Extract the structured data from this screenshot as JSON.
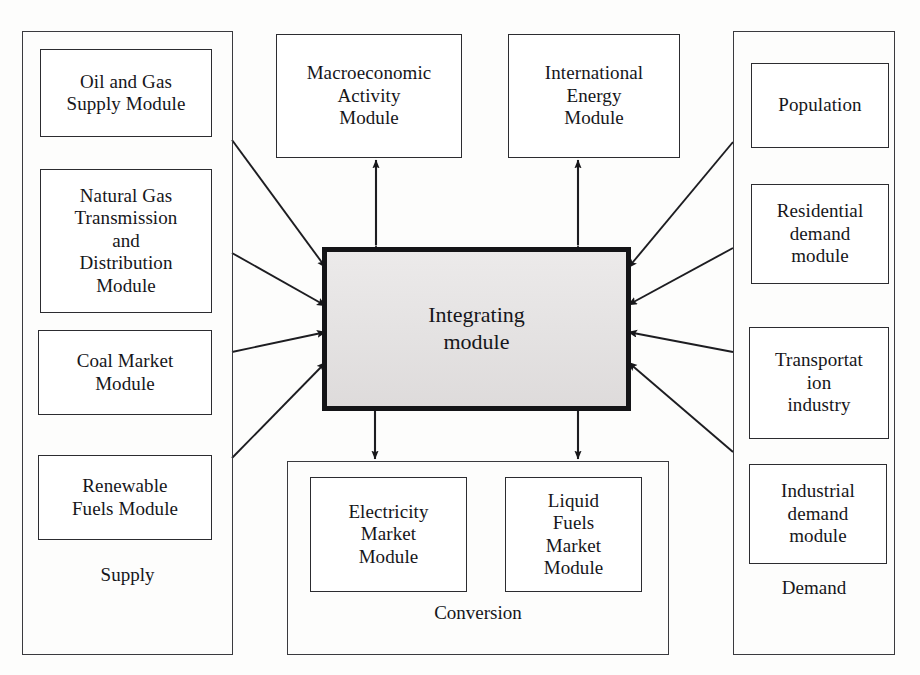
{
  "diagram": {
    "background_color": "#fdfdfc",
    "line_color": "#2c2c30",
    "center_fill_color": "#e8e6e6"
  },
  "center": {
    "label": "Integrating\nmodule"
  },
  "supply": {
    "caption": "Supply",
    "modules": [
      {
        "label": "Oil and Gas\nSupply Module"
      },
      {
        "label": "Natural Gas\nTransmission\nand\nDistribution\nModule"
      },
      {
        "label": "Coal Market\nModule"
      },
      {
        "label": "Renewable\nFuels Module"
      }
    ]
  },
  "demand": {
    "caption": "Demand",
    "modules": [
      {
        "label": "Population"
      },
      {
        "label": "Residential\ndemand\nmodule"
      },
      {
        "label": "Transportat\nion\nindustry"
      },
      {
        "label": "Industrial\ndemand\nmodule"
      }
    ]
  },
  "conversion": {
    "caption": "Conversion",
    "modules": [
      {
        "label": "Electricity\nMarket\nModule"
      },
      {
        "label": "Liquid\nFuels\nMarket\nModule"
      }
    ]
  },
  "top": {
    "modules": [
      {
        "label": "Macroeconomic\nActivity\nModule"
      },
      {
        "label": "International\nEnergy\nModule"
      }
    ]
  },
  "connections": [
    {
      "name": "supply-oil-gas-to-center",
      "direction": "one-way",
      "from": "supply",
      "to": "center"
    },
    {
      "name": "supply-natural-gas-to-center",
      "direction": "one-way",
      "from": "supply",
      "to": "center"
    },
    {
      "name": "supply-coal-to-center",
      "direction": "one-way",
      "from": "supply",
      "to": "center"
    },
    {
      "name": "supply-renewable-to-center",
      "direction": "one-way",
      "from": "supply",
      "to": "center"
    },
    {
      "name": "demand-population-to-center",
      "direction": "one-way",
      "from": "demand",
      "to": "center"
    },
    {
      "name": "demand-residential-to-center",
      "direction": "one-way",
      "from": "demand",
      "to": "center"
    },
    {
      "name": "demand-transportation-to-center",
      "direction": "one-way",
      "from": "demand",
      "to": "center"
    },
    {
      "name": "demand-industrial-to-center",
      "direction": "one-way",
      "from": "demand",
      "to": "center"
    },
    {
      "name": "center-to-macroeconomic",
      "direction": "two-way",
      "from": "center",
      "to": "macroeconomic-activity-module"
    },
    {
      "name": "center-to-international-energy",
      "direction": "two-way",
      "from": "center",
      "to": "international-energy-module"
    },
    {
      "name": "center-to-electricity-market",
      "direction": "one-way",
      "from": "center",
      "to": "conversion"
    },
    {
      "name": "center-to-liquid-fuels",
      "direction": "one-way",
      "from": "center",
      "to": "conversion"
    }
  ]
}
